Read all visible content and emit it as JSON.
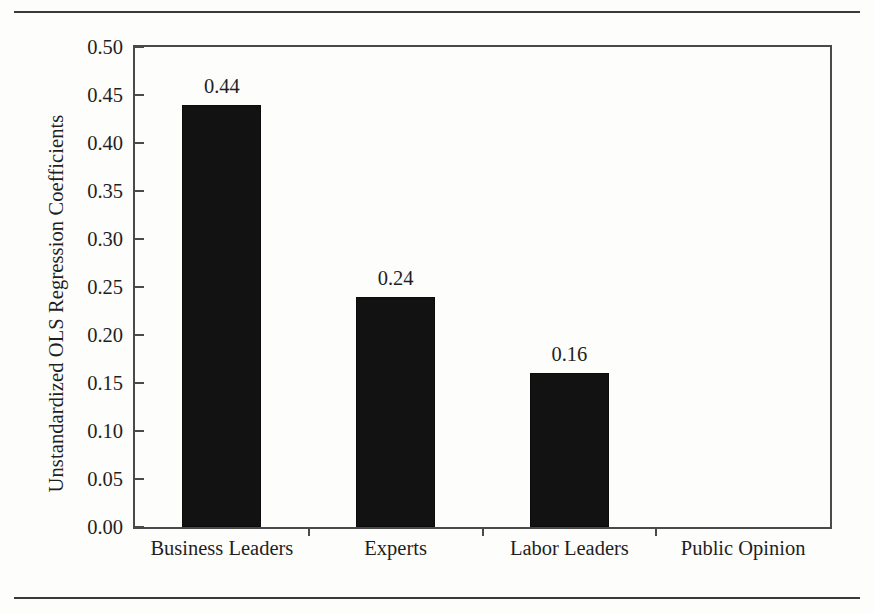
{
  "chart_data": {
    "type": "bar",
    "title": "",
    "subtitle": "",
    "xlabel": "",
    "ylabel": "Unstandardized OLS Regression Coefficients",
    "categories": [
      "Business Leaders",
      "Experts",
      "Labor Leaders",
      "Public Opinion"
    ],
    "values": [
      0.44,
      0.24,
      0.16,
      0.0
    ],
    "value_labels": [
      "0.44",
      "0.24",
      "0.16",
      ""
    ],
    "ylim": [
      0.0,
      0.5
    ],
    "ytick_values": [
      0.0,
      0.05,
      0.1,
      0.15,
      0.2,
      0.25,
      0.3,
      0.35,
      0.4,
      0.45,
      0.5
    ],
    "ytick_labels": [
      "0.00",
      "0.05",
      "0.10",
      "0.15",
      "0.20",
      "0.25",
      "0.30",
      "0.35",
      "0.40",
      "0.45",
      "0.50"
    ],
    "grid": false,
    "legend": false,
    "legend_position": "none",
    "bar_color": "#121212",
    "axis_color": "#4a4a4a",
    "background_color": "#fdfdfc",
    "text_color": "#1f1f1f"
  },
  "figure": {
    "has_top_rule": true,
    "has_bottom_rule": true,
    "rule_color": "#3a3a3a"
  }
}
